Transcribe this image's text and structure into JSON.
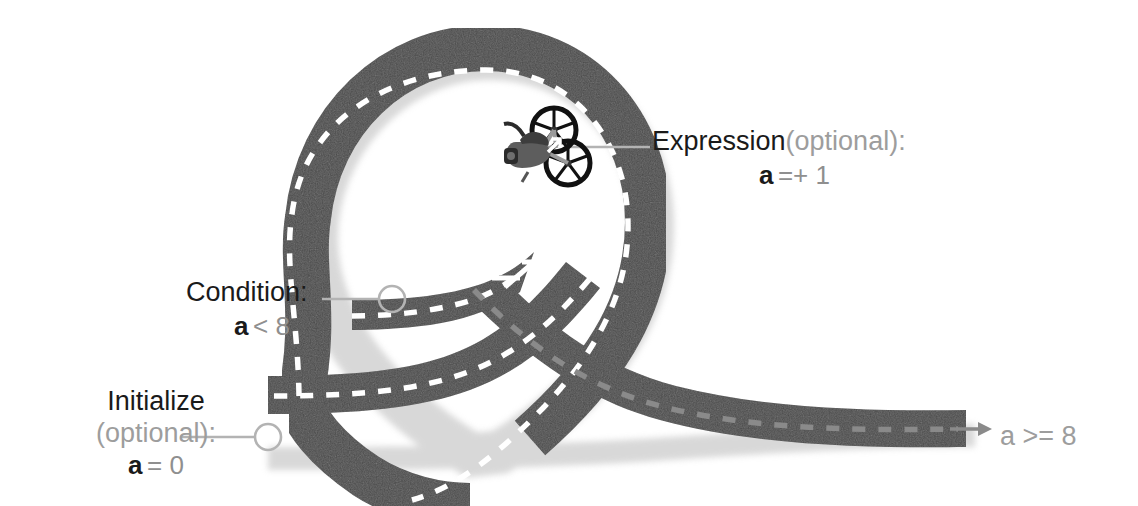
{
  "diagram": {
    "background_color": "#ffffff",
    "road_color": "#4a4a4a",
    "road_shadow_color": "#bdbdbd",
    "lane_marking_color": "#ffffff",
    "leader_color": "#b3b3b3",
    "text_black": "#1a1a1a",
    "text_gray": "#9d9d9d",
    "vehicle": "motorcycle-icon"
  },
  "labels": {
    "expression": {
      "name": "Expression",
      "optional": "(optional):",
      "var": "a",
      "op": "=+ 1"
    },
    "condition": {
      "name": "Condition:",
      "var": "a",
      "op": "< 8"
    },
    "initialize": {
      "name": "Initialize",
      "optional": "(optional):",
      "var": "a",
      "op": "= 0"
    },
    "exit": {
      "text": "a >= 8"
    }
  },
  "markers": {
    "initialize_marker": "circle-marker",
    "condition_marker": "circle-marker",
    "expression_marker": "leader-line",
    "loop_branch_arrow": "arrow-up-right-icon",
    "exit_arrow": "arrow-right-icon"
  }
}
